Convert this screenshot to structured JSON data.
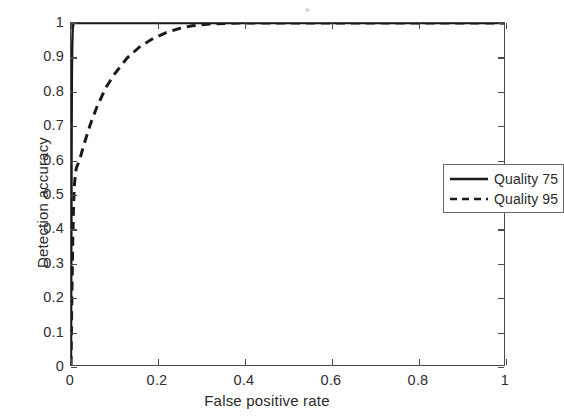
{
  "chart_data": {
    "type": "line",
    "title": "",
    "subtitle": "",
    "xlabel": "False positive rate",
    "ylabel": "Detection accuracy",
    "xlim": [
      0,
      1
    ],
    "ylim": [
      0,
      1
    ],
    "grid": false,
    "legend_position": "upper-right-inside",
    "xticks": [
      0,
      0.2,
      0.4,
      0.6,
      0.8,
      1
    ],
    "xticklabels": [
      "0",
      "0.2",
      "0.4",
      "0.6",
      "0.8",
      "1"
    ],
    "yticks": [
      0,
      0.1,
      0.2,
      0.3,
      0.4,
      0.5,
      0.6,
      0.7,
      0.8,
      0.9,
      1
    ],
    "yticklabels": [
      "0",
      "0.1",
      "0.2",
      "0.3",
      "0.4",
      "0.5",
      "0.6",
      "0.7",
      "0.8",
      "0.9",
      "1"
    ],
    "series": [
      {
        "name": "Quality 75",
        "style": "solid",
        "color": "#1a1a1a",
        "x": [
          0,
          0.0005,
          0.001,
          0.0015,
          0.002,
          0.003,
          0.004,
          0.006,
          0.02,
          0.1,
          0.3,
          0.6,
          1
        ],
        "y": [
          0,
          0.22,
          0.45,
          0.68,
          0.84,
          0.94,
          0.985,
          1,
          1,
          1,
          1,
          1,
          1
        ]
      },
      {
        "name": "Quality 95",
        "style": "dashed",
        "color": "#1a1a1a",
        "x": [
          0,
          0.002,
          0.004,
          0.006,
          0.008,
          0.012,
          0.02,
          0.03,
          0.045,
          0.06,
          0.08,
          0.1,
          0.13,
          0.16,
          0.19,
          0.22,
          0.25,
          0.28,
          0.32,
          0.4,
          0.5,
          0.7,
          1
        ],
        "y": [
          0,
          0.2,
          0.36,
          0.47,
          0.53,
          0.575,
          0.6,
          0.645,
          0.705,
          0.755,
          0.81,
          0.85,
          0.898,
          0.932,
          0.955,
          0.972,
          0.984,
          0.992,
          0.997,
          1,
          1,
          1,
          1
        ]
      }
    ]
  },
  "legend": {
    "entries": [
      {
        "label": "Quality 75",
        "style": "solid"
      },
      {
        "label": "Quality 95",
        "style": "dashed"
      }
    ]
  },
  "axes": {
    "xlabel": "False positive rate",
    "ylabel": "Detection accuracy"
  },
  "colors": {
    "curve": "#1a1a1a",
    "frame": "#4a4a4a",
    "text": "#2b2b2b",
    "background": "#ffffff"
  }
}
